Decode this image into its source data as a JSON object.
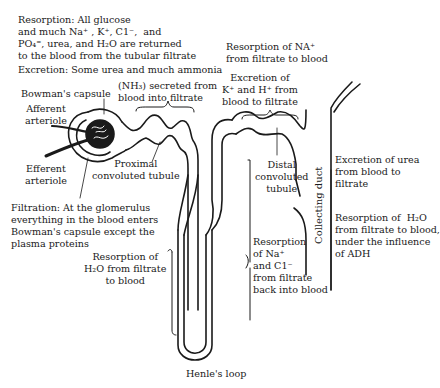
{
  "diagram": {
    "labels": {
      "resorption_top": "Resorption: All glucose\nand much Na⁺ , K⁺, C1⁻,  and\nPO₄⁼, urea, and H₂O are returned\nto the blood from the tubular filtrate",
      "excretion_top": "Excretion: Some urea and much ammonia",
      "nh3": "(NH₃) secreted from\nblood into filtrate",
      "bowmans_capsule": "Bowman's capsule",
      "afferent_arteriole": "Afferent\narteriole",
      "efferent_arteriole": "Efferent\narteriole",
      "proximal_tubule": "Proximal\nconvoluted tubule",
      "filtration": "Filtration: At the glomerulus\neverything in the blood enters\nBowman's capsule except the\nplasma proteins",
      "resorption_h2o_loop": "Resorption of\nH₂O from filtrate\nto blood",
      "resorption_na_distal": "Resorption of NA⁺\nfrom filtrate to blood",
      "excretion_k_h": "Excretion of\nK⁺ and H⁺ from\nblood to filtrate",
      "distal_tubule": "Distal\nconvoluted\ntubule",
      "collecting_duct": "Collecting duct",
      "resorption_nacl": "Resorption\nof Na⁺\nand C1⁻\nfrom filtrate\nback into blood",
      "excretion_urea": "Excretion of urea\nfrom blood to\nfiltrate",
      "resorption_h2o_adh": "Resorption of  H₂O\nfrom filtrate to blood,\nunder the influence\nof ADH",
      "henles_loop": "Henle's loop"
    },
    "colors": {
      "ink": "#1a1a1a",
      "background": "#ffffff"
    }
  }
}
